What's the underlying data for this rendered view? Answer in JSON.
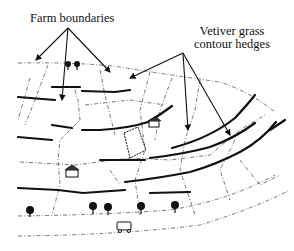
{
  "diagram": {
    "labels": {
      "farm_boundaries": "Farm boundaries",
      "vetiver_line1": "Vetiver grass",
      "vetiver_line2": "contour hedges"
    },
    "colors": {
      "background": "#ffffff",
      "ink": "#111111",
      "dashed": "#555555"
    },
    "elements": [
      "farm-boundary-lines",
      "vetiver-hedge-lines",
      "annotation-arrows",
      "trees",
      "houses",
      "vehicle"
    ]
  }
}
